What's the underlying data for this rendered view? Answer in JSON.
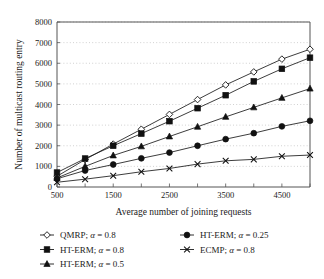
{
  "chart_data": {
    "type": "line",
    "title": "",
    "xlabel": "Average number of joining requests",
    "ylabel": "Number of multicast routing entry",
    "x": [
      500,
      1000,
      1500,
      2000,
      2500,
      3000,
      3500,
      4000,
      4500,
      5000
    ],
    "xlim": [
      500,
      5000
    ],
    "ylim": [
      0,
      8000
    ],
    "xticks": [
      500,
      1000,
      1500,
      2000,
      2500,
      3000,
      3500,
      4000,
      4500,
      5000
    ],
    "xtick_labels": [
      "500",
      "",
      "1500",
      "",
      "2500",
      "",
      "3500",
      "",
      "4500",
      ""
    ],
    "yticks": [
      0,
      1000,
      2000,
      3000,
      4000,
      5000,
      6000,
      7000,
      8000
    ],
    "ytick_labels": [
      "0",
      "1000",
      "2000",
      "3000",
      "4000",
      "5000",
      "6000",
      "7000",
      "8000"
    ],
    "grid": "horizontal-dotted",
    "legend_position": "below-plot",
    "series": [
      {
        "name": "QMRP; α = 0.8",
        "marker": "open-diamond",
        "values": [
          520,
          1330,
          2080,
          2800,
          3520,
          4240,
          4950,
          5580,
          6200,
          6680
        ]
      },
      {
        "name": "HT-ERM; α = 0.8",
        "marker": "filled-square",
        "values": [
          700,
          1380,
          2000,
          2590,
          3190,
          3820,
          4450,
          5120,
          5730,
          6270
        ]
      },
      {
        "name": "HT-ERM; α = 0.5",
        "marker": "filled-triangle",
        "values": [
          440,
          1000,
          1530,
          1970,
          2450,
          2920,
          3400,
          3860,
          4320,
          4770
        ]
      },
      {
        "name": "HT-ERM; α = 0.25",
        "marker": "filled-circle",
        "values": [
          400,
          800,
          1090,
          1390,
          1670,
          2000,
          2320,
          2610,
          2940,
          3210
        ]
      },
      {
        "name": "ECMP; α = 0.8",
        "marker": "cross-x",
        "values": [
          230,
          380,
          550,
          740,
          900,
          1110,
          1270,
          1340,
          1490,
          1550
        ]
      }
    ]
  },
  "legend": {
    "entries": [
      {
        "label": "QMRP; ",
        "alpha": "α",
        "value": " = 0.8",
        "marker": "open-diamond"
      },
      {
        "label": "HT-ERM; ",
        "alpha": "α",
        "value": " = 0.8",
        "marker": "filled-square"
      },
      {
        "label": "HT-ERM; ",
        "alpha": "α",
        "value": " = 0.5",
        "marker": "filled-triangle"
      },
      {
        "label": "HT-ERM; ",
        "alpha": "α",
        "value": " = 0.25",
        "marker": "filled-circle"
      },
      {
        "label": "ECMP; ",
        "alpha": "α",
        "value": " = 0.8",
        "marker": "cross-x"
      }
    ]
  },
  "colors": {
    "ink": "#1a1a1a",
    "grid": "#bdbdbd",
    "axis": "#555555",
    "background": "#ffffff"
  }
}
